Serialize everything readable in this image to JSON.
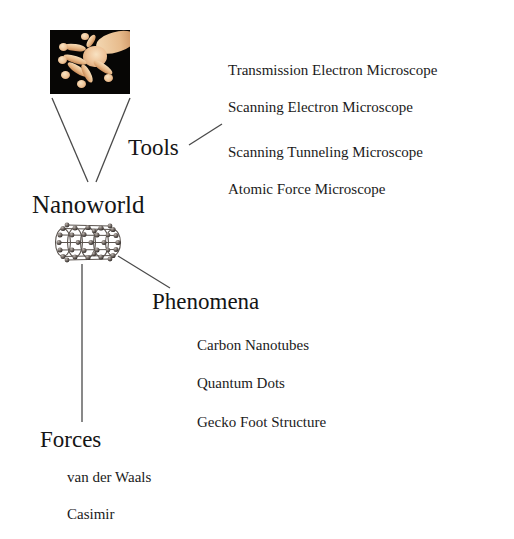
{
  "diagram": {
    "background_color": "#ffffff",
    "line_color": "#4a4a4a",
    "text_color": "#151515",
    "root": {
      "label": "Nanoworld"
    },
    "branches": [
      {
        "id": "tools",
        "label": "Tools",
        "items": [
          "Transmission Electron Microscope",
          "Scanning Electron Microscope",
          "Scanning Tunneling Microscope",
          "Atomic Force Microscope"
        ]
      },
      {
        "id": "phenomena",
        "label": "Phenomena",
        "items": [
          "Carbon Nanotubes",
          "Quantum Dots",
          "Gecko Foot Structure"
        ]
      },
      {
        "id": "forces",
        "label": "Forces",
        "items": [
          "van der Waals",
          "Casimir"
        ]
      }
    ],
    "images": [
      {
        "id": "gecko-foot-photo",
        "caption": "",
        "description": "gecko foot photograph on black background",
        "background_color": "#070605",
        "tissue_color": "#eec197"
      },
      {
        "id": "carbon-nanotube-model",
        "caption": "",
        "description": "ball-and-stick carbon nanotube model",
        "atom_color": "#4b4440"
      }
    ]
  }
}
